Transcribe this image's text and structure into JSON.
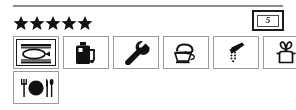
{
  "panel": {
    "divider": "horizontal-rule"
  },
  "rating": {
    "label": "Star rating",
    "value": 5,
    "max": 5,
    "stars": [
      "star",
      "star",
      "star",
      "star",
      "star"
    ],
    "color": "#111111"
  },
  "badge": {
    "name": "category-badge",
    "text": "5",
    "border_color": "#1a1a1a"
  },
  "amenities": {
    "rows": [
      {
        "items": [
          {
            "icon": "ironing-board-icon",
            "label": "Ironing"
          },
          {
            "icon": "fuel-can-icon",
            "label": "Fuel"
          },
          {
            "icon": "wrench-icon",
            "label": "Repairs"
          },
          {
            "icon": "coffee-cup-icon",
            "label": "Cafe"
          },
          {
            "icon": "shower-icon",
            "label": "Shower"
          },
          {
            "icon": "hairdryer-icon",
            "label": "Hairdresser"
          }
        ]
      },
      {
        "items": [
          {
            "icon": "restaurant-icon",
            "label": "Restaurant"
          }
        ]
      }
    ]
  }
}
